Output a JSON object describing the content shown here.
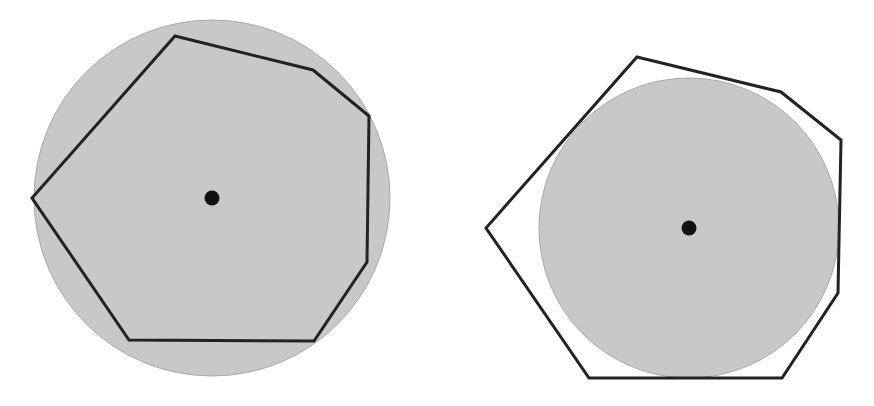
{
  "diagram": {
    "colors": {
      "background": "#ffffff",
      "circle_fill": "#c8c8c8",
      "circle_stroke": "#a8a8a8",
      "polygon_stroke": "#222222",
      "center_dot": "#111111"
    },
    "figures": [
      {
        "name": "inscribed-heptagon",
        "circle": {
          "cx": 212,
          "cy": 198,
          "r": 178
        },
        "polygon_points": "175,36 313,70 369,116 367,262 314,341 129,340 32,198",
        "center_dot": {
          "cx": 212,
          "cy": 198,
          "r": 7.5
        }
      },
      {
        "name": "circumscribed-heptagon",
        "circle": {
          "cx": 689,
          "cy": 228,
          "r": 150
        },
        "polygon_points": "637,57 781,92 841,140 838,293 782,378 589,378 486,228",
        "center_dot": {
          "cx": 689,
          "cy": 228,
          "r": 7.5
        }
      }
    ]
  }
}
